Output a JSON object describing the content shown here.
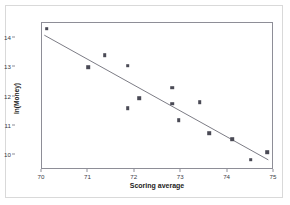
{
  "chart_data": {
    "type": "scatter",
    "title": "",
    "xlabel": "Scoring average",
    "ylabel": "ln(Money)",
    "xlim": [
      70,
      75
    ],
    "ylim": [
      9.5,
      14.5
    ],
    "xticks": [
      70,
      71,
      72,
      73,
      74,
      75
    ],
    "yticks": [
      10,
      11,
      12,
      13,
      14
    ],
    "grid": false,
    "legend": null,
    "marker_color": "#4a4a55",
    "line_color": "#7a7a84",
    "frame_color": "#8e8e97",
    "points": [
      {
        "x": 70.1,
        "y": 14.3
      },
      {
        "x": 71.0,
        "y": 13.0
      },
      {
        "x": 71.35,
        "y": 13.4
      },
      {
        "x": 71.85,
        "y": 13.05
      },
      {
        "x": 71.85,
        "y": 11.6
      },
      {
        "x": 72.1,
        "y": 11.95
      },
      {
        "x": 72.8,
        "y": 12.3
      },
      {
        "x": 72.8,
        "y": 11.75
      },
      {
        "x": 72.95,
        "y": 11.2
      },
      {
        "x": 73.4,
        "y": 11.8
      },
      {
        "x": 73.6,
        "y": 10.75
      },
      {
        "x": 74.1,
        "y": 10.55
      },
      {
        "x": 74.5,
        "y": 9.85
      },
      {
        "x": 74.85,
        "y": 10.1
      }
    ],
    "trend_line": {
      "x_start": 70.05,
      "y_start": 14.08,
      "x_end": 74.92,
      "y_end": 9.78
    }
  }
}
